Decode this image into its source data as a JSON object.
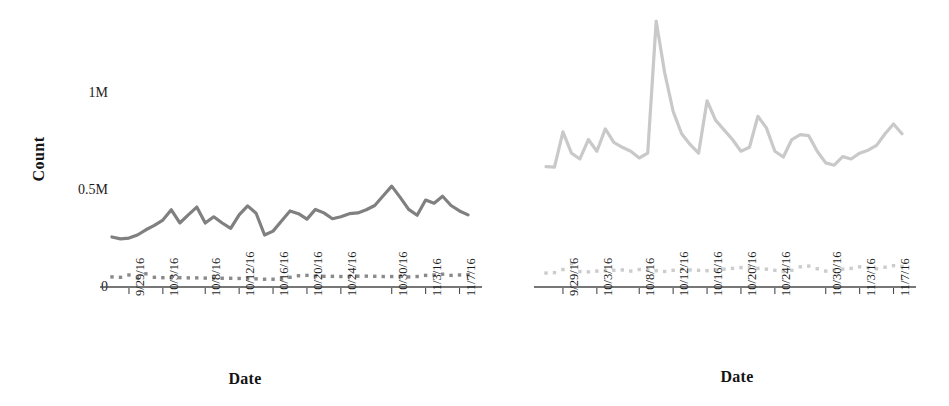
{
  "chart_data": [
    {
      "type": "line",
      "panel": "left",
      "title": "",
      "xlabel": "Date",
      "ylabel": "Count",
      "grid": false,
      "legend": "none",
      "ylim": [
        0,
        1450000
      ],
      "yticks": [
        0,
        500000,
        1000000
      ],
      "ytick_labels": [
        "0",
        "0.5M",
        "1M"
      ],
      "x_tick_labels": [
        "9/29/16",
        "10/3/16",
        "10/8/16",
        "10/12/16",
        "10/16/16",
        "10/20/16",
        "10/24/16",
        "10/30/16",
        "11/3/16",
        "11/7/16"
      ],
      "x": [
        "9/27/16",
        "9/28/16",
        "9/29/16",
        "9/30/16",
        "10/1/16",
        "10/2/16",
        "10/3/16",
        "10/4/16",
        "10/5/16",
        "10/6/16",
        "10/7/16",
        "10/8/16",
        "10/9/16",
        "10/10/16",
        "10/11/16",
        "10/12/16",
        "10/13/16",
        "10/14/16",
        "10/15/16",
        "10/16/16",
        "10/17/16",
        "10/18/16",
        "10/19/16",
        "10/20/16",
        "10/21/16",
        "10/22/16",
        "10/23/16",
        "10/24/16",
        "10/25/16",
        "10/26/16",
        "10/27/16",
        "10/28/16",
        "10/29/16",
        "10/30/16",
        "10/31/16",
        "11/1/16",
        "11/2/16",
        "11/3/16",
        "11/4/16",
        "11/5/16",
        "11/6/16",
        "11/7/16",
        "11/8/16"
      ],
      "series": [
        {
          "name": "primary-count",
          "style": "solid",
          "color": "#808080",
          "values": [
            258000,
            248000,
            252000,
            268000,
            295000,
            318000,
            345000,
            398000,
            330000,
            372000,
            412000,
            330000,
            362000,
            330000,
            302000,
            372000,
            418000,
            380000,
            268000,
            288000,
            340000,
            392000,
            378000,
            350000,
            400000,
            382000,
            352000,
            362000,
            378000,
            382000,
            398000,
            420000,
            470000,
            520000,
            462000,
            400000,
            370000,
            448000,
            432000,
            468000,
            420000,
            392000,
            372000
          ]
        },
        {
          "name": "secondary-count",
          "style": "dotted-square-markers",
          "color": "#8a8a8a",
          "values": [
            52000,
            50000,
            62000,
            47000,
            68000,
            50000,
            48000,
            48000,
            48000,
            47000,
            47000,
            46000,
            46000,
            45000,
            45000,
            44000,
            43000,
            42000,
            40000,
            40000,
            42000,
            50000,
            58000,
            60000,
            56000,
            55000,
            55000,
            54000,
            55000,
            56000,
            56000,
            55000,
            54000,
            54000,
            55000,
            52000,
            54000,
            60000,
            62000,
            66000,
            60000,
            62000,
            64000
          ]
        }
      ]
    },
    {
      "type": "line",
      "panel": "right",
      "title": "",
      "xlabel": "Date",
      "ylabel": "",
      "grid": false,
      "legend": "none",
      "ylim": [
        0,
        1450000
      ],
      "yticks": [
        0,
        500000,
        1000000
      ],
      "x_tick_labels": [
        "9/29/16",
        "10/3/16",
        "10/8/16",
        "10/12/16",
        "10/16/16",
        "10/20/16",
        "10/24/16",
        "10/30/16",
        "11/3/16",
        "11/7/16"
      ],
      "x": [
        "9/27/16",
        "9/28/16",
        "9/29/16",
        "9/30/16",
        "10/1/16",
        "10/2/16",
        "10/3/16",
        "10/4/16",
        "10/5/16",
        "10/6/16",
        "10/7/16",
        "10/8/16",
        "10/9/16",
        "10/10/16",
        "10/11/16",
        "10/12/16",
        "10/13/16",
        "10/14/16",
        "10/15/16",
        "10/16/16",
        "10/17/16",
        "10/18/16",
        "10/19/16",
        "10/20/16",
        "10/21/16",
        "10/22/16",
        "10/23/16",
        "10/24/16",
        "10/25/16",
        "10/26/16",
        "10/27/16",
        "10/28/16",
        "10/29/16",
        "10/30/16",
        "10/31/16",
        "11/1/16",
        "11/2/16",
        "11/3/16",
        "11/4/16",
        "11/5/16",
        "11/6/16",
        "11/7/16",
        "11/8/16"
      ],
      "series": [
        {
          "name": "primary-count",
          "style": "solid",
          "color": "#c9c9c9",
          "values": [
            620000,
            618000,
            800000,
            690000,
            660000,
            760000,
            700000,
            815000,
            745000,
            720000,
            700000,
            665000,
            690000,
            1370000,
            1105000,
            905000,
            790000,
            735000,
            690000,
            960000,
            860000,
            810000,
            760000,
            700000,
            720000,
            880000,
            820000,
            700000,
            670000,
            760000,
            785000,
            780000,
            700000,
            640000,
            628000,
            672000,
            660000,
            690000,
            705000,
            730000,
            790000,
            840000,
            790000
          ]
        },
        {
          "name": "secondary-count",
          "style": "dotted-square-markers",
          "color": "#cccccc",
          "values": [
            72000,
            74000,
            90000,
            120000,
            80000,
            78000,
            82000,
            84000,
            86000,
            88000,
            82000,
            90000,
            88000,
            84000,
            80000,
            86000,
            92000,
            88000,
            86000,
            84000,
            88000,
            92000,
            96000,
            100000,
            102000,
            96000,
            92000,
            86000,
            80000,
            86000,
            104000,
            108000,
            94000,
            82000,
            88000,
            92000,
            96000,
            104000,
            100000,
            94000,
            102000,
            110000,
            106000
          ]
        }
      ]
    }
  ]
}
